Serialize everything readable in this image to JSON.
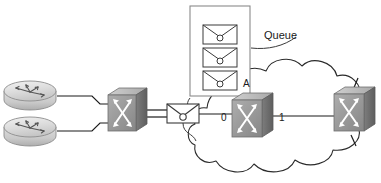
{
  "diagram": {
    "canvas": {
      "width": 381,
      "height": 183
    },
    "background_color": "#ffffff",
    "labels": {
      "queue": "Queue",
      "node_a": "A",
      "port_in": "0",
      "port_out": "1"
    },
    "colors": {
      "line": "#1a1a1a",
      "switch_front": "#9a9a9a",
      "switch_top": "#bdbdbd",
      "switch_side": "#6e6e6e",
      "switch_arrow": "#ffffff",
      "router_body": "#d4d4d4",
      "router_top": "#e8e8e8",
      "envelope_fill": "#ffffff",
      "envelope_stroke": "#3a3a3a",
      "cloud_stroke": "#2b2b2b",
      "queue_box_stroke": "#808080"
    },
    "nodes": [
      {
        "name": "router-top",
        "type": "router",
        "x": 30,
        "y": 91
      },
      {
        "name": "router-bottom",
        "type": "router",
        "x": 30,
        "y": 127
      },
      {
        "name": "switch-edge",
        "type": "switch",
        "x": 122,
        "y": 113
      },
      {
        "name": "packet-inflight",
        "type": "envelope",
        "x": 183,
        "y": 114
      },
      {
        "name": "switch-a",
        "type": "switch",
        "x": 250,
        "y": 118
      },
      {
        "name": "switch-remote",
        "type": "switch",
        "x": 353,
        "y": 112
      }
    ],
    "queue": {
      "name": "queue-box",
      "x": 190,
      "y": 6,
      "width": 60,
      "height": 90,
      "packet_count": 3,
      "packets": [
        "packet-1",
        "packet-2",
        "packet-3"
      ]
    },
    "cloud": {
      "name": "network-cloud",
      "label": ""
    },
    "links": [
      {
        "from": "router-top",
        "to": "switch-edge",
        "style": "step"
      },
      {
        "from": "router-bottom",
        "to": "switch-edge",
        "style": "step"
      },
      {
        "from": "switch-edge",
        "to": "packet-inflight",
        "style": "straight"
      },
      {
        "from": "packet-inflight",
        "to": "switch-a",
        "style": "straight"
      },
      {
        "from": "switch-a",
        "to": "switch-remote",
        "style": "straight"
      }
    ]
  }
}
